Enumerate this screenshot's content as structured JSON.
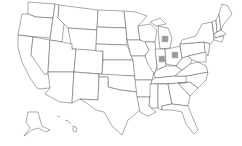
{
  "map": {
    "title": "",
    "region": "United States",
    "highlighted_states": [
      {
        "state": "Michigan",
        "abbr": "MI",
        "x": 165,
        "y": 38
      },
      {
        "state": "Indiana",
        "abbr": "IN",
        "x": 161,
        "y": 56
      },
      {
        "state": "Ohio",
        "abbr": "OH",
        "x": 173,
        "y": 52
      }
    ],
    "marker_color": "#9a9a9a",
    "border_color": "#555555"
  }
}
